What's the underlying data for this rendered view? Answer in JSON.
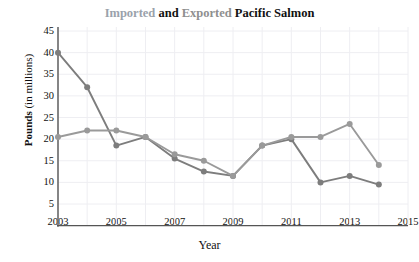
{
  "chart_data": {
    "type": "line",
    "title": "Imported and Exported Pacific Salmon",
    "title_parts": {
      "imported": "Imported",
      "and": "and",
      "exported": "Exported",
      "subject": "Pacific Salmon"
    },
    "xlabel": "Year",
    "ylabel_bold": "Pounds",
    "ylabel_rest": "(in millions)",
    "ylabel": "Pounds (in millions)",
    "x": [
      2003,
      2004,
      2005,
      2006,
      2007,
      2008,
      2009,
      2010,
      2011,
      2012,
      2013,
      2014
    ],
    "xlim": [
      2003,
      2015
    ],
    "ylim": [
      0,
      45
    ],
    "yticks": [
      45,
      40,
      35,
      30,
      25,
      20,
      15,
      10,
      5
    ],
    "xticks": [
      2003,
      2005,
      2007,
      2009,
      2011,
      2013,
      2015
    ],
    "grid": true,
    "legend_position": "none",
    "series": [
      {
        "name": "Exported",
        "color": "#7d7d7d",
        "values": [
          40,
          32,
          18.5,
          20.5,
          15.5,
          12.5,
          11.5,
          18.5,
          20,
          10,
          11.5,
          9.5
        ]
      },
      {
        "name": "Imported",
        "color": "#9a9a9a",
        "values": [
          20.5,
          22,
          22,
          20.5,
          16.5,
          15,
          11.5,
          18.5,
          20.5,
          20.5,
          23.5,
          14
        ]
      }
    ]
  },
  "axis": {
    "ytick_labels": [
      "45",
      "40",
      "35",
      "30",
      "25",
      "20",
      "15",
      "10",
      "5"
    ],
    "xtick_labels": [
      "2003",
      "2005",
      "2007",
      "2009",
      "2011",
      "2013",
      "2015"
    ]
  },
  "colors": {
    "series_dark": "#7d7d7d",
    "series_light": "#9a9a9a",
    "axis": "#555555",
    "grid": "#eeeef2",
    "text": "#111111",
    "title_imported": "#9aa2ab",
    "title_exported": "#8f8f8f"
  }
}
